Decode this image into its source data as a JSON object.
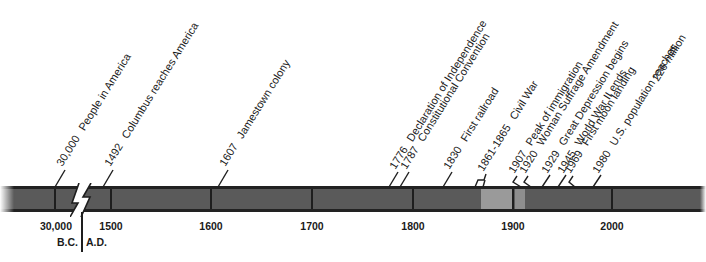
{
  "timeline": {
    "axis_ticks": [
      {
        "label": "30,000",
        "x": 55
      },
      {
        "label": "1500",
        "x": 111
      },
      {
        "label": "1600",
        "x": 211
      },
      {
        "label": "1700",
        "x": 312
      },
      {
        "label": "1800",
        "x": 413
      },
      {
        "label": "1900",
        "x": 513
      },
      {
        "label": "2000",
        "x": 612
      }
    ],
    "era_labels": {
      "bc": "B.C.",
      "ad": "A.D."
    },
    "colors": {
      "bar": "#5a5a5a",
      "bar_border": "#222222",
      "highlight_1": "#9a9a9a",
      "highlight_2": "#8e8e8e"
    },
    "events": [
      {
        "year": "30,000",
        "text": "People in America",
        "x": 55
      },
      {
        "year": "1492",
        "text": "Columbus reaches America",
        "x": 103
      },
      {
        "year": "1607",
        "text": "Jamestown colony",
        "x": 218
      },
      {
        "year": "1776",
        "text": "Declaration of Independence",
        "x": 389
      },
      {
        "year": "1787",
        "text": "Constitutional Convention",
        "x": 400
      },
      {
        "year": "1830",
        "text": "First railroad",
        "x": 443
      },
      {
        "year": "1861-1865",
        "text": "Civil War",
        "x": 478
      },
      {
        "year": "1907",
        "text": "Peak of immigration",
        "x": 520
      },
      {
        "year": "1920",
        "text": "Woman Suffrage Amendment",
        "x": 533
      },
      {
        "year": "1929",
        "text": "Great Depression begins",
        "x": 542
      },
      {
        "year": "1945",
        "text": "World War II ends",
        "x": 558
      },
      {
        "year": "1969",
        "text": "First moon landing",
        "x": 582
      },
      {
        "year": "1980",
        "text": "U.S. population reaches",
        "text2": "226 million",
        "x": 593
      }
    ]
  }
}
